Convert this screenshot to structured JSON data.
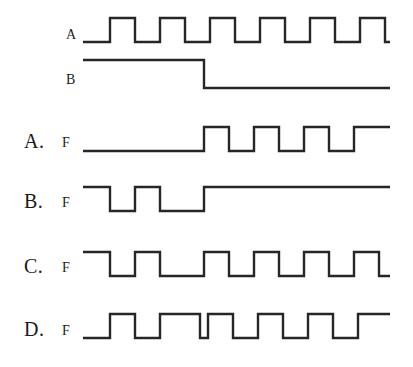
{
  "figure": {
    "stroke_color": "#262626",
    "background_color": "#ffffff",
    "width": 413,
    "height": 367
  },
  "inputs": [
    {
      "id": "input-a",
      "label": "A",
      "label_x": 66,
      "label_y": 28,
      "row_top": 0,
      "high_y": 18,
      "low_y": 42,
      "x_start": 83,
      "x_end": 390,
      "start_level": "low",
      "description": "Square-wave clock with six high pulses",
      "transitions": [
        110,
        135,
        160,
        185,
        210,
        235,
        260,
        285,
        310,
        335,
        360,
        385
      ]
    },
    {
      "id": "input-b",
      "label": "B",
      "label_x": 66,
      "label_y": 73,
      "row_top": 0,
      "high_y": 60,
      "low_y": 88,
      "x_start": 83,
      "x_end": 390,
      "start_level": "high",
      "description": "Starts high, falls once at mid-scale and stays low",
      "transitions": [
        204
      ]
    }
  ],
  "options": [
    {
      "id": "option-a",
      "choice_label": "A.",
      "signal_label": "F",
      "choice_x": 24,
      "choice_y": 131,
      "signal_x": 62,
      "signal_y": 136,
      "high_y": 127,
      "low_y": 151,
      "x_start": 83,
      "x_end": 390,
      "start_level": "low",
      "description": "Low until mid-scale, then pulses and ends high",
      "transitions": [
        204,
        229,
        254,
        279,
        304,
        329,
        354
      ]
    },
    {
      "id": "option-b",
      "choice_label": "B.",
      "signal_label": "F",
      "choice_x": 24,
      "choice_y": 191,
      "signal_x": 62,
      "signal_y": 196,
      "high_y": 187,
      "low_y": 211,
      "x_start": 83,
      "x_end": 390,
      "start_level": "high",
      "description": "Two low dips near the left, then high for the remainder",
      "transitions": [
        110,
        135,
        160,
        204
      ]
    },
    {
      "id": "option-c",
      "choice_label": "C.",
      "signal_label": "F",
      "choice_x": 24,
      "choice_y": 256,
      "signal_x": 62,
      "signal_y": 261,
      "high_y": 252,
      "low_y": 276,
      "x_start": 83,
      "x_end": 390,
      "start_level": "high",
      "description": "Starts high, inverted clock with a wide low at mid-scale",
      "transitions": [
        110,
        135,
        160,
        204,
        229,
        254,
        279,
        304,
        329,
        354,
        379
      ]
    },
    {
      "id": "option-d",
      "choice_label": "D.",
      "signal_label": "F",
      "choice_x": 24,
      "choice_y": 319,
      "signal_x": 62,
      "signal_y": 324,
      "high_y": 314,
      "low_y": 338,
      "x_start": 83,
      "x_end": 390,
      "start_level": "low",
      "description": "Clock-like pulse train with a narrow low near mid-scale",
      "transitions": [
        110,
        135,
        160,
        200,
        208,
        233,
        258,
        283,
        308,
        333,
        358
      ]
    }
  ]
}
